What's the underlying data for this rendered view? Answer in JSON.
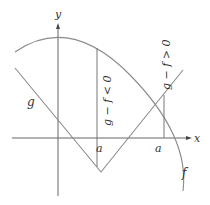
{
  "diagram": {
    "axes": {
      "x_label": "x",
      "y_label": "y"
    },
    "curves": {
      "f_label": "f",
      "g_label": "g"
    },
    "annotations": {
      "left_inequality": "g − f < 0",
      "right_inequality": "g − f > 0",
      "left_point_label": "a",
      "right_point_label": "a"
    },
    "colors": {
      "curve": "#8a8a8a",
      "axis": "#555555",
      "text": "#333333"
    }
  }
}
